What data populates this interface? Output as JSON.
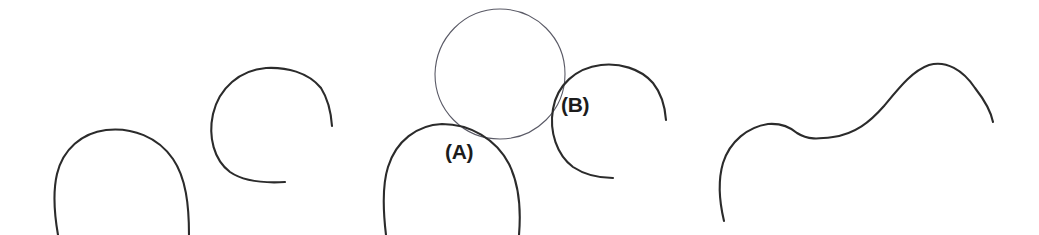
{
  "figure": {
    "canvas": {
      "width": 1039,
      "height": 235,
      "background_color": "#ffffff"
    },
    "stroke_colors": {
      "thick_arc": "#2b2b2b",
      "thin_circle": "#5a5a66"
    },
    "labels": [
      {
        "id": "label-a",
        "text": "(A)",
        "x": 445,
        "y": 159
      },
      {
        "id": "label-b",
        "text": "(B)",
        "x": 561,
        "y": 112
      }
    ],
    "shapes": [
      {
        "id": "shape-1-arch",
        "name": "open-arch-curve",
        "kind": "arc",
        "description": "Upward open arch, roughly upper half of a circle, open at the bottom",
        "center": [
          121,
          196
        ],
        "radius": 66,
        "span_degrees": 200,
        "bbox": [
          53,
          130,
          190,
          235
        ],
        "stroke": "#2b2b2b",
        "stroke_width": 2.1
      },
      {
        "id": "shape-2-open-circle",
        "name": "near-closed-circle-curve",
        "kind": "arc",
        "description": "Nearly closed circle with a gap on the right side",
        "center": [
          272,
          128
        ],
        "radius": 60,
        "span_degrees": 300,
        "bbox": [
          212,
          68,
          333,
          186
        ],
        "stroke": "#2b2b2b",
        "stroke_width": 2.1
      },
      {
        "id": "shape-3-thin-circle",
        "name": "tangent-reference-circle",
        "kind": "circle",
        "description": "Thin full circle resting tangentially on arcs (A) and (B)",
        "center": [
          500,
          74
        ],
        "radius": 65,
        "bbox": [
          435,
          9,
          565,
          139
        ],
        "stroke": "#5a5a66",
        "stroke_width": 1.1
      },
      {
        "id": "shape-3-arc-a",
        "name": "arc-a-curve",
        "kind": "arc",
        "label": "(A)",
        "description": "Upward open arch tangent to the thin circle from below-left",
        "center": [
          451,
          192
        ],
        "radius": 68,
        "span_degrees": 200,
        "bbox": [
          382,
          124,
          520,
          235
        ],
        "stroke": "#2b2b2b",
        "stroke_width": 2.1
      },
      {
        "id": "shape-3-arc-b",
        "name": "arc-b-curve",
        "kind": "arc",
        "label": "(B)",
        "description": "Nearly closed circle with a gap on the right, tangent to the thin circle from below-right",
        "center": [
          610,
          122
        ],
        "radius": 57,
        "span_degrees": 300,
        "bbox": [
          553,
          64,
          668,
          180
        ],
        "stroke": "#2b2b2b",
        "stroke_width": 2.1
      },
      {
        "id": "shape-4-wave",
        "name": "s-wave-curve",
        "kind": "wave",
        "description": "Smooth S-shaped wave: rises from lower-left to a small plateau, dips, rises to a tall crest, then falls",
        "bbox": [
          722,
          62,
          994,
          222
        ],
        "key_points": [
          [
            722,
            221
          ],
          [
            782,
            125
          ],
          [
            833,
            138
          ],
          [
            940,
            63
          ],
          [
            993,
            122
          ]
        ],
        "stroke": "#2b2b2b",
        "stroke_width": 2.1
      }
    ]
  }
}
